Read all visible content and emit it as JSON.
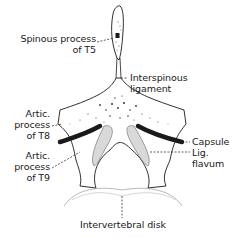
{
  "diagram": {
    "labels": {
      "spinous_process_line1": "Spinous process",
      "spinous_process_line2": "of T5",
      "interspinous_line1": "Interspinous",
      "interspinous_line2": "ligament",
      "artic_t8_line1": "Artic.",
      "artic_t8_line2": "process",
      "artic_t8_line3": "of T8",
      "artic_t9_line1": "Artic.",
      "artic_t9_line2": "process",
      "artic_t9_line3": "of T9",
      "capsule": "Capsule",
      "lig_flavum_line1": "Lig.",
      "lig_flavum_line2": "flavum",
      "intervertebral_disk": "Intervertebral disk"
    },
    "colors": {
      "ink": "#1a1a1a",
      "stipple": "#555555",
      "background": "#ffffff"
    }
  }
}
